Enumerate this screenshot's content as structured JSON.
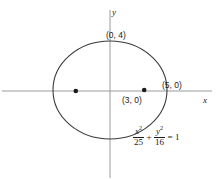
{
  "figure": {
    "kind": "ellipse-graph",
    "background_color": "#ffffff",
    "axis_color": "#9a9a9a",
    "curve_color": "#3a3a3a",
    "point_color": "#1b1b1b",
    "text_color": "#1b1b1b"
  },
  "axes": {
    "x_label": "x",
    "y_label": "y",
    "origin_px": {
      "x": 110,
      "y": 91
    },
    "x_line_px": {
      "x1": 2,
      "y1": 91,
      "x2": 212,
      "y2": 91
    },
    "y_line_px": {
      "x1": 110,
      "y1": 10,
      "x2": 110,
      "y2": 178
    }
  },
  "chart_data": {
    "type": "scatter",
    "title": "",
    "xlabel": "x",
    "ylabel": "y",
    "grid": false,
    "legend": null,
    "xlim": [
      -7.4,
      9.3
    ],
    "ylim": [
      -7.0,
      6.6
    ],
    "curves": [
      {
        "name": "ellipse",
        "equation": "x^2/25 + y^2/16 = 1",
        "center": [
          0,
          0
        ],
        "semi_major_a": 5,
        "semi_minor_b": 4,
        "orientation": "horizontal",
        "c": 3
      }
    ],
    "points": [
      {
        "name": "focus-left",
        "x": -3,
        "y": 0,
        "label": "",
        "marker": "dot"
      },
      {
        "name": "focus-right",
        "x": 3,
        "y": 0,
        "label": "(3, 0)",
        "marker": "dot"
      }
    ],
    "annotations": [
      {
        "name": "top-vertex-label",
        "text": "(0, 4)",
        "x": 0,
        "y": 4
      },
      {
        "name": "right-vertex-label",
        "text": "(5, 0)",
        "x": 5,
        "y": 0
      },
      {
        "name": "focus-right-label",
        "text": "(3, 0)",
        "x": 3,
        "y": 0
      },
      {
        "name": "equation-label",
        "text": "x^2/25 + y^2/16 = 1",
        "x": 4.2,
        "y": -3.6
      }
    ]
  },
  "labels": {
    "top_vertex": "(0, 4)",
    "right_vertex": "(5, 0)",
    "focus_right": "(3, 0)"
  },
  "equation": {
    "numerator_1": "x",
    "exponent_1": "2",
    "denominator_1": "25",
    "operator": "+",
    "numerator_2": "y",
    "exponent_2": "2",
    "denominator_2": "16",
    "equals": "= 1"
  }
}
